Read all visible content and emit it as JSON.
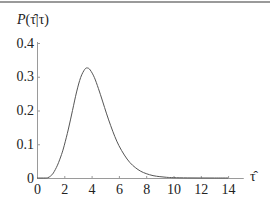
{
  "chart_data": {
    "type": "line",
    "title": "",
    "xlabel": "τ̂",
    "ylabel": "P(τ̂|τ)",
    "xlim": [
      0,
      15
    ],
    "ylim": [
      0,
      0.4
    ],
    "grid": false,
    "legend": null,
    "x_ticks": [
      0,
      2,
      4,
      6,
      8,
      10,
      12,
      14
    ],
    "x_tick_labels": [
      "0",
      "2",
      "4",
      "6",
      "8",
      "10",
      "12",
      "14"
    ],
    "y_ticks": [
      0,
      0.1,
      0.2,
      0.3,
      0.4
    ],
    "y_tick_labels": [
      "0",
      "0.1",
      "0.2",
      "0.3",
      "0.4"
    ],
    "series": [
      {
        "name": "P(τ̂|τ)",
        "color": "#555555",
        "x": [
          0,
          0.6,
          0.8,
          1.0,
          1.2,
          1.5,
          1.8,
          2.0,
          2.3,
          2.6,
          2.9,
          3.2,
          3.5,
          3.7,
          3.9,
          4.2,
          4.5,
          4.8,
          5.1,
          5.4,
          5.7,
          6.0,
          6.4,
          6.8,
          7.2,
          7.6,
          8.0,
          8.5,
          9.0,
          9.5,
          10.0,
          11,
          12,
          13,
          14
        ],
        "values": [
          0,
          0,
          0.001,
          0.006,
          0.015,
          0.038,
          0.07,
          0.097,
          0.145,
          0.2,
          0.255,
          0.298,
          0.322,
          0.326,
          0.32,
          0.298,
          0.265,
          0.228,
          0.19,
          0.155,
          0.123,
          0.096,
          0.068,
          0.046,
          0.031,
          0.02,
          0.013,
          0.007,
          0.004,
          0.002,
          0.001,
          0.0003,
          0.0001,
          0,
          0
        ]
      }
    ],
    "annotations": []
  },
  "axes": {
    "x_label": "τ̂",
    "y_label_main": "P",
    "y_label_args": "(τ̂|τ)"
  }
}
